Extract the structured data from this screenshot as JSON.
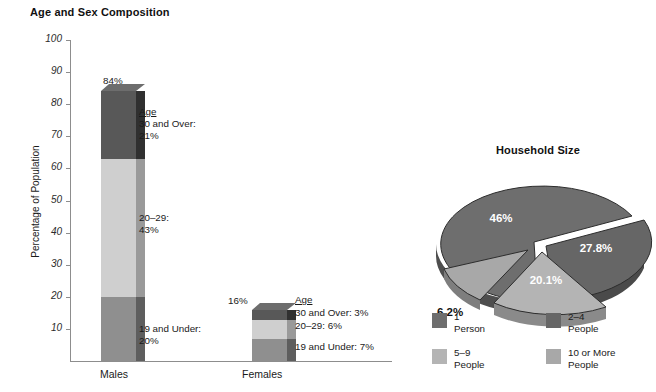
{
  "chart_data": [
    {
      "type": "bar",
      "title": "Age and Sex Composition",
      "xlabel": "",
      "ylabel": "Percentage of Population",
      "ylim": [
        0,
        100
      ],
      "ytick_labels": [
        "100",
        "90",
        "80",
        "70",
        "60",
        "50",
        "40",
        "30",
        "20",
        "10"
      ],
      "ytick_values": [
        100,
        90,
        80,
        70,
        60,
        50,
        40,
        30,
        20,
        10
      ],
      "grid": false,
      "stacked": true,
      "categories": [
        "Males",
        "Females"
      ],
      "series": [
        {
          "name": "19 and Under",
          "values": [
            20,
            7
          ],
          "color": "#8f8f8f"
        },
        {
          "name": "20-29",
          "values": [
            43,
            6
          ],
          "color": "#cfcfcf"
        },
        {
          "name": "30 and Over",
          "values": [
            21,
            3
          ],
          "color": "#585858"
        }
      ],
      "totals": [
        84,
        16
      ],
      "total_labels": [
        "84%",
        "16%"
      ],
      "annotations": {
        "males": {
          "heading": "Age",
          "lines": [
            "30 and Over:",
            "21%",
            "20–29:",
            "43%",
            "19 and Under:",
            "20%"
          ],
          "over30": "30 and Over:",
          "over30_pct": "21%",
          "mid": "20–29:",
          "mid_pct": "43%",
          "under19": "19 and Under:",
          "under19_pct": "20%"
        },
        "females": {
          "heading": "Age",
          "over30": "30 and Over: 3%",
          "mid": "20–29: 6%",
          "under19": "19 and Under: 7%"
        }
      }
    },
    {
      "type": "pie",
      "title": "Household Size",
      "exploded": true,
      "three_d": true,
      "labels": [
        "1 Person",
        "2–4 People",
        "5–9 People",
        "10 or More People"
      ],
      "values": [
        46,
        27.8,
        20.1,
        6.2
      ],
      "value_labels": [
        "46%",
        "27.8%",
        "20.1%",
        "6.2%"
      ],
      "legend_position": "bottom",
      "legend": [
        {
          "label_line1": "1",
          "label_line2": "Person",
          "color": "#6e6e6e"
        },
        {
          "label_line1": "2–4",
          "label_line2": "People",
          "color": "#666666"
        },
        {
          "label_line1": "5–9",
          "label_line2": "People",
          "color": "#b4b4b4"
        },
        {
          "label_line1": "10 or More",
          "label_line2": "People",
          "color": "#a8a8a8"
        }
      ]
    }
  ],
  "bar": {
    "title": "Age and Sex Composition",
    "ylabel": "Percentage of Population",
    "yticks": [
      "100",
      "90",
      "80",
      "70",
      "60",
      "50",
      "40",
      "30",
      "20",
      "10"
    ],
    "cat_males": "Males",
    "cat_females": "Females",
    "males_total": "84%",
    "females_total": "16%",
    "males_anno": {
      "heading": "Age",
      "over30": "30 and Over:",
      "over30_pct": "21%",
      "mid": "20–29:",
      "mid_pct": "43%",
      "under19": "19 and Under:",
      "under19_pct": "20%"
    },
    "females_anno": {
      "heading": "Age",
      "over30": "30 and Over: 3%",
      "mid": "20–29: 6%",
      "under19": "19 and Under: 7%"
    }
  },
  "pie": {
    "title": "Household Size",
    "slice1": "46%",
    "slice2": "27.8%",
    "slice3": "20.1%",
    "slice4": "6.2%",
    "legend": [
      {
        "l1": "1",
        "l2": "Person"
      },
      {
        "l1": "2–4",
        "l2": "People"
      },
      {
        "l1": "5–9",
        "l2": "People"
      },
      {
        "l1": "10 or More",
        "l2": "People"
      }
    ]
  },
  "colors": {
    "seg_dark": "#585858",
    "seg_dark_side": "#333333",
    "seg_light": "#cfcfcf",
    "seg_light_side": "#9a9a9a",
    "seg_mid": "#8f8f8f",
    "seg_mid_side": "#5e5e5e",
    "pie_dark": "#6e6e6e",
    "pie_light": "#b4b4b4",
    "axis": "#8d8d8d"
  }
}
